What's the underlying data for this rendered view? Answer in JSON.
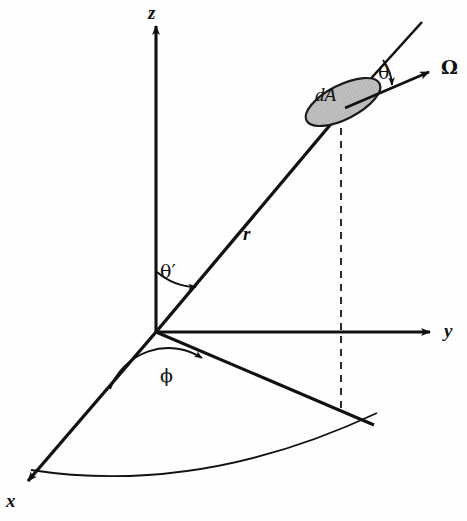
{
  "figure": {
    "type": "spherical-coordinate-diagram",
    "background_color": "#fefefe",
    "stroke_color": "#111111",
    "surface_fill_color": "#b5b5b5"
  },
  "axes": [
    {
      "id": "z",
      "label": "z",
      "label_x": 148,
      "label_y": 3,
      "style": "italic-bold"
    },
    {
      "id": "y",
      "label": "y",
      "label_x": 444,
      "label_y": 321,
      "style": "italic-bold"
    },
    {
      "id": "x",
      "label": "x",
      "label_x": 6,
      "label_y": 491,
      "style": "italic-bold"
    }
  ],
  "vectors": [
    {
      "id": "r",
      "label": "r",
      "label_x": 243,
      "label_y": 224,
      "style": "italic-bold"
    },
    {
      "id": "omega",
      "label": "Ω",
      "label_x": 441,
      "label_y": 58,
      "style": "greek-bold"
    }
  ],
  "surface": {
    "id": "dA",
    "label": "dA",
    "label_x": 315,
    "label_y": 85,
    "center_x": 343,
    "center_y": 102,
    "rx": 41,
    "ry": 17,
    "rotation_deg": -27,
    "fill": "#b5b5b5"
  },
  "angles": [
    {
      "id": "theta",
      "label": "θ",
      "label_x": 378,
      "label_y": 63,
      "description": "angle between r-extension and Omega"
    },
    {
      "id": "theta-prime",
      "label": "θ′",
      "label_x": 160,
      "label_y": 262,
      "description": "polar angle from z-axis to r"
    },
    {
      "id": "phi",
      "label": "ϕ",
      "label_x": 160,
      "label_y": 366,
      "description": "azimuthal angle from x-axis to projection of r"
    }
  ],
  "geometry": {
    "origin": {
      "x": 156,
      "y": 332
    },
    "z_axis_tip": {
      "x": 156,
      "y": 20
    },
    "y_axis_tip": {
      "x": 437,
      "y": 332
    },
    "x_axis_tip": {
      "x": 22,
      "y": 487
    },
    "r_tip": {
      "x": 340,
      "y": 113
    },
    "r_extension_tip": {
      "x": 422,
      "y": 22
    },
    "omega_tip": {
      "x": 436,
      "y": 69
    },
    "dA_point": {
      "x": 345,
      "y": 108
    },
    "projection_tip": {
      "x": 374,
      "y": 425
    },
    "dashed_drop_x": 341,
    "dashed_drop_top_y": 128,
    "dashed_drop_bottom_y": 414
  }
}
